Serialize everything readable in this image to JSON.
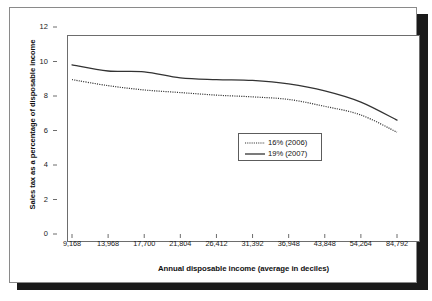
{
  "chart_data": {
    "type": "line",
    "title": "",
    "xlabel": "Annual disposable income (average in deciles)",
    "ylabel": "Sales tax as a percentage of disposable income",
    "categories": [
      "9,168",
      "13,968",
      "17,700",
      "21,804",
      "26,412",
      "31,392",
      "36,948",
      "43,848",
      "54,264",
      "84,792"
    ],
    "x_tick_labels": [
      "9,168",
      "13,968",
      "17,700",
      "21,804",
      "26,412",
      "31,392",
      "36,948",
      "43,848",
      "54,264",
      "84,792"
    ],
    "y_tick_labels": [
      "0",
      "2",
      "4",
      "6",
      "8",
      "10",
      "12"
    ],
    "ylim": [
      0,
      12
    ],
    "y_tick_step": 2,
    "grid": false,
    "legend_position": "center",
    "series": [
      {
        "name": "16% (2006)",
        "style": "dotted",
        "color": "#333333",
        "values": [
          8.95,
          8.6,
          8.35,
          8.2,
          8.05,
          7.95,
          7.8,
          7.4,
          6.9,
          5.9
        ]
      },
      {
        "name": "19% (2007)",
        "style": "solid",
        "color": "#333333",
        "values": [
          9.8,
          9.45,
          9.4,
          9.05,
          8.95,
          8.9,
          8.7,
          8.3,
          7.65,
          6.6
        ]
      }
    ]
  },
  "legend": {
    "items": [
      {
        "label": "16% (2006)",
        "style": "dotted"
      },
      {
        "label": "19% (2007)",
        "style": "solid"
      }
    ]
  },
  "axes": {
    "y_title": "Sales tax as a percentage of disposable income",
    "x_title": "Annual disposable income (average in deciles)"
  }
}
